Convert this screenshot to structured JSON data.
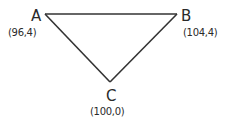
{
  "diagram": {
    "type": "triangle",
    "stroke_color": "#333333",
    "text_color": "#2a2a2a",
    "background": "#ffffff",
    "vertices": [
      {
        "name": "A",
        "coords_label": "(96,4)",
        "x": 96,
        "y": 4
      },
      {
        "name": "B",
        "coords_label": "(104,4)",
        "x": 104,
        "y": 4
      },
      {
        "name": "C",
        "coords_label": "(100,0)",
        "x": 100,
        "y": 0
      }
    ],
    "edges": [
      {
        "from": "A",
        "to": "B"
      },
      {
        "from": "B",
        "to": "C"
      },
      {
        "from": "C",
        "to": "A"
      }
    ]
  }
}
